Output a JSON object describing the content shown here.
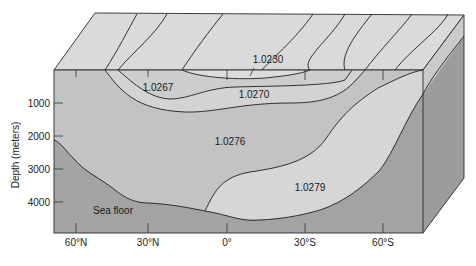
{
  "diagram": {
    "y_axis": {
      "label": "Depth (meters)",
      "ticks": [
        {
          "value": "1000",
          "y": 103
        },
        {
          "value": "2000",
          "y": 136
        },
        {
          "value": "3000",
          "y": 169
        },
        {
          "value": "4000",
          "y": 202
        }
      ]
    },
    "x_axis": {
      "ticks": [
        {
          "value": "60°N",
          "x": 76
        },
        {
          "value": "30°N",
          "x": 148
        },
        {
          "value": "0°",
          "x": 227
        },
        {
          "value": "30°S",
          "x": 305
        },
        {
          "value": "60°S",
          "x": 383
        }
      ]
    },
    "density_labels": [
      {
        "value": "1.0230",
        "x": 268,
        "y": 63
      },
      {
        "value": "1.0267",
        "x": 143,
        "y": 91
      },
      {
        "value": "1.0270",
        "x": 238,
        "y": 98
      },
      {
        "value": "1.0276",
        "x": 215,
        "y": 145
      },
      {
        "value": "1.0279",
        "x": 295,
        "y": 191
      }
    ],
    "sea_floor_label": "Sea floor",
    "colors": {
      "top_surface": "#d9d9d9",
      "upper_water": "#cfcfcf",
      "water_1_0276": "#c4c4c4",
      "water_1_0279": "#d4d4d4",
      "sea_floor": "#a3a3a3",
      "side_face": "#9a9a9a",
      "side_face_upper": "#c8c8c8"
    }
  }
}
